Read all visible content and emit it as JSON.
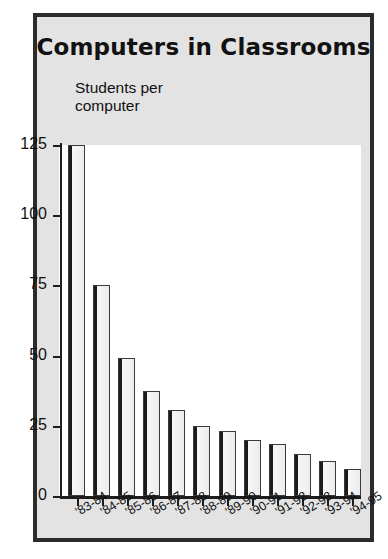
{
  "chart_data": {
    "type": "bar",
    "title": "Computers in Classrooms",
    "subtitle": "Students per computer",
    "xlabel": "",
    "ylabel": "Students per computer",
    "ylim": [
      0,
      125
    ],
    "yticks": [
      0,
      25,
      50,
      75,
      100,
      125
    ],
    "ytick_labels": [
      "0",
      "25",
      "50",
      "75",
      "100",
      "125"
    ],
    "grid": false,
    "legend": "none",
    "categories": [
      "'83-84",
      "'84-85",
      "'85-86",
      "'86-87",
      "'87-88",
      "'88-89",
      "'89-90",
      "'90-91",
      "'91-92",
      "'92-93",
      "'93-94",
      "'94-95"
    ],
    "values": [
      125,
      75,
      49,
      37.5,
      30.5,
      25,
      23,
      20,
      18.5,
      15,
      12.5,
      9.5
    ]
  },
  "colors": {
    "frame": "#2b2b2b",
    "panel_background": "#e3e3e3",
    "plot_background": "#ffffff",
    "axis": "#1d1d1d",
    "bar_face": "#ececec",
    "bar_shadow": "#1b1b1b",
    "text": "#111111"
  }
}
